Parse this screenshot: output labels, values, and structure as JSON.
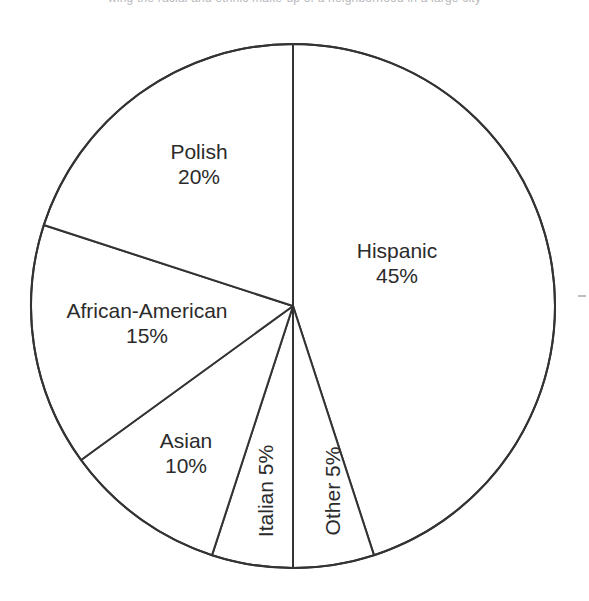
{
  "page": {
    "background_color": "#ffffff",
    "top_cropped_text": "wing the racial and ethnic make-up of a neighborhood in a large city"
  },
  "chart_data": {
    "type": "pie",
    "title": "",
    "xlabel": "",
    "ylabel": "",
    "legend": "none",
    "grid": false,
    "stroke_color": "#333333",
    "fill_color": "#ffffff",
    "start_angle_deg": 0,
    "direction": "clockwise",
    "categories": [
      "Hispanic",
      "Other",
      "Italian",
      "Asian",
      "African-American",
      "Polish"
    ],
    "values": [
      45,
      5,
      5,
      10,
      15,
      20
    ],
    "units": "%",
    "slices": [
      {
        "label": "Hispanic",
        "percent_text": "45%",
        "value": 45,
        "start_pct": 0,
        "end_pct": 45,
        "label_rotation_deg": 0
      },
      {
        "label": "Other",
        "percent_text": "5%",
        "value": 5,
        "start_pct": 45,
        "end_pct": 50,
        "label_rotation_deg": -90
      },
      {
        "label": "Italian",
        "percent_text": "5%",
        "value": 5,
        "start_pct": 50,
        "end_pct": 55,
        "label_rotation_deg": -90
      },
      {
        "label": "Asian",
        "percent_text": "10%",
        "value": 10,
        "start_pct": 55,
        "end_pct": 65,
        "label_rotation_deg": 0
      },
      {
        "label": "African-American",
        "percent_text": "15%",
        "value": 15,
        "start_pct": 65,
        "end_pct": 80,
        "label_rotation_deg": 0
      },
      {
        "label": "Polish",
        "percent_text": "20%",
        "value": 20,
        "start_pct": 80,
        "end_pct": 100,
        "label_rotation_deg": 0
      }
    ]
  },
  "geometry": {
    "center_x": 293,
    "center_y": 306,
    "radius": 262
  }
}
